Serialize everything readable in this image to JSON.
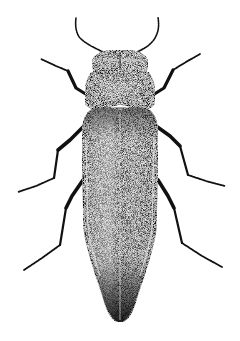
{
  "illustration": {
    "subject": "beetle",
    "style": "stippled pen-and-ink, dorsal view",
    "background": "#ffffff",
    "ink": "#111111",
    "parts": {
      "antennae": 2,
      "legs": 6,
      "head": 1,
      "pronotum": 1,
      "elytra": 2
    }
  }
}
